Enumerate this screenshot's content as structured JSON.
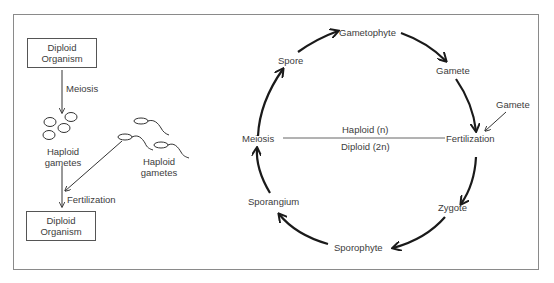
{
  "left_panel": {
    "top_box": {
      "line1": "Diploid",
      "line2": "Organism"
    },
    "meiosis_label": "Meiosis",
    "haploid_gametes_left": {
      "line1": "Haploid",
      "line2": "gametes"
    },
    "haploid_gametes_right": {
      "line1": "Haploid",
      "line2": "gametes"
    },
    "fertilization_label": "Fertilization",
    "bottom_box": {
      "line1": "Diploid",
      "line2": "Organism"
    }
  },
  "cycle": {
    "nodes": {
      "gametophyte": "Gametophyte",
      "gamete": "Gamete",
      "gamete_external": "Gamete",
      "fertilization": "Fertilization",
      "zygote": "Zygote",
      "sporophyte": "Sporophyte",
      "sporangium": "Sporangium",
      "meiosis": "Meiosis",
      "spore": "Spore"
    },
    "divider": {
      "top": "Haploid (n)",
      "bottom": "Diploid (2n)"
    }
  },
  "colors": {
    "stroke": "#222222",
    "frame": "#8a8a8a",
    "text": "#3c3c3c"
  }
}
